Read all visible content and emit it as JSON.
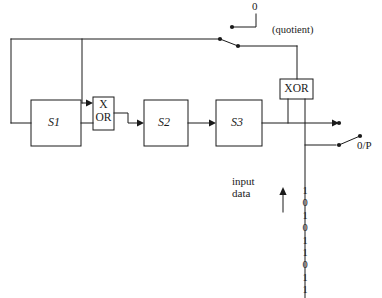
{
  "figure": {
    "type": "logic-circuit-diagram",
    "stroke_color": "#1a1a1a",
    "background_color": "#ffffff"
  },
  "blocks": [
    {
      "id": "s1",
      "label": "S1"
    },
    {
      "id": "s2",
      "label": "S2"
    },
    {
      "id": "s3",
      "label": "S3"
    }
  ],
  "gates": [
    {
      "id": "xor_in",
      "label_line1": "X",
      "label_line2": "OR"
    },
    {
      "id": "xor_out",
      "label": "XOR"
    }
  ],
  "labels": {
    "zero_terminal": "0",
    "quotient": "(quotient)",
    "output": "0/P",
    "input_data_line1": "input",
    "input_data_line2": "data"
  },
  "bit_stream": {
    "name": "input-data-bits",
    "order": "top-to-bottom",
    "bits": [
      "1",
      "0",
      "1",
      "0",
      "1",
      "1",
      "0",
      "1",
      "1"
    ]
  }
}
